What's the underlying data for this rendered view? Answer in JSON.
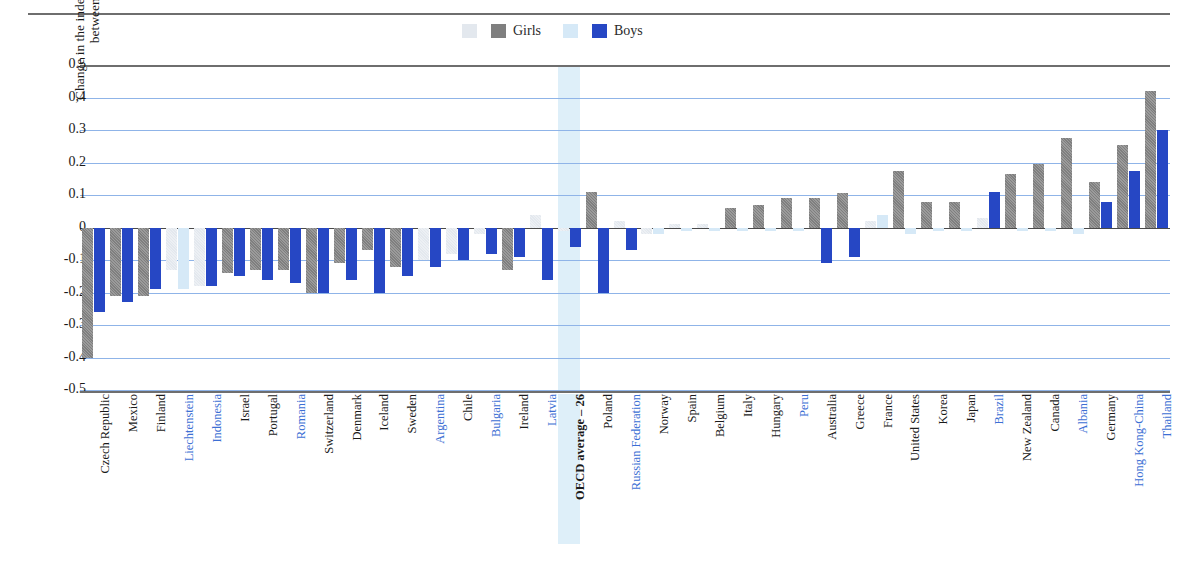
{
  "figure": {
    "title_fragment": "",
    "y_axis_title_line1": "Change in the index of enjoyment of reading",
    "y_axis_title_line2": "between 2000 and 2009"
  },
  "legend": {
    "items": [
      {
        "name": "girls-light-swatch",
        "label": "",
        "color": "#e3e8ee"
      },
      {
        "name": "girls-swatch",
        "label": "Girls",
        "color": "#7f7f7f"
      },
      {
        "name": "boys-light-swatch",
        "label": "",
        "color": "#d6e9f7"
      },
      {
        "name": "boys-swatch",
        "label": "Boys",
        "color": "#2647c4"
      }
    ]
  },
  "colors": {
    "girls_significant": "#7f7f7f",
    "girls_not_significant": "#e3e8ee",
    "boys_significant": "#2647c4",
    "boys_not_significant": "#d6e9f7",
    "gridline": "#8fb4e8",
    "partner_label": "#3c6fd4",
    "oecd_highlight": "#d8ecf8"
  },
  "chart_data": {
    "type": "bar",
    "xlabel": "",
    "ylabel": "Change in the index of enjoyment of reading between 2000 and 2009",
    "ylim": [
      -0.5,
      0.5
    ],
    "yticks": [
      "0.5",
      "0,4",
      "0.3",
      "0.2",
      "0.1",
      "0",
      "-0.1",
      "-0.2",
      "-0.3",
      "-0.4",
      "-0.5"
    ],
    "grid": true,
    "legend_position": "top-center",
    "categories": [
      "Czech Republic",
      "Mexico",
      "Finland",
      "Liechtenstein",
      "Indonesia",
      "Israel",
      "Portugal",
      "Romania",
      "Switzerland",
      "Denmark",
      "Iceland",
      "Sweden",
      "Argentina",
      "Chile",
      "Bulgaria",
      "Ireland",
      "Latvia",
      "OECD average – 26",
      "Poland",
      "Russian Federation",
      "Norway",
      "Spain",
      "Belgium",
      "Italy",
      "Hungary",
      "Peru",
      "Australia",
      "Greece",
      "France",
      "United States",
      "Korea",
      "Japan",
      "Brazil",
      "New Zealand",
      "Canada",
      "Albania",
      "Germany",
      "Hong Kong-China",
      "Thailand"
    ],
    "partner_economies": [
      "Liechtenstein",
      "Indonesia",
      "Romania",
      "Argentina",
      "Bulgaria",
      "Latvia",
      "Russian Federation",
      "Peru",
      "Brazil",
      "Albania",
      "Hong Kong-China",
      "Thailand"
    ],
    "oecd_average_category": "OECD average – 26",
    "series": [
      {
        "name": "Girls",
        "values": [
          -0.4,
          -0.21,
          -0.21,
          -0.13,
          -0.18,
          -0.14,
          -0.13,
          -0.13,
          -0.2,
          -0.11,
          -0.07,
          -0.12,
          -0.1,
          -0.08,
          -0.02,
          -0.13,
          0.04,
          -0.01,
          0.11,
          0.02,
          -0.02,
          0.01,
          0.01,
          0.06,
          0.07,
          0.09,
          0.09,
          0.105,
          0.02,
          0.175,
          0.08,
          0.08,
          0.03,
          0.165,
          0.195,
          0.275,
          0.14,
          0.255,
          0.42
        ],
        "significance": [
          true,
          true,
          true,
          false,
          false,
          true,
          true,
          true,
          true,
          true,
          true,
          true,
          false,
          false,
          false,
          true,
          false,
          false,
          true,
          false,
          false,
          false,
          false,
          true,
          true,
          true,
          true,
          true,
          false,
          true,
          true,
          true,
          false,
          true,
          true,
          true,
          true,
          true,
          true
        ]
      },
      {
        "name": "Boys",
        "values": [
          -0.26,
          -0.23,
          -0.19,
          -0.19,
          -0.18,
          -0.15,
          -0.16,
          -0.17,
          -0.2,
          -0.16,
          -0.2,
          -0.15,
          -0.12,
          -0.1,
          -0.08,
          -0.09,
          -0.16,
          -0.06,
          -0.2,
          -0.07,
          -0.02,
          -0.01,
          -0.01,
          -0.01,
          -0.01,
          -0.01,
          -0.11,
          -0.09,
          0.04,
          -0.02,
          -0.01,
          -0.01,
          0.11,
          -0.01,
          -0.01,
          -0.02,
          0.08,
          0.175,
          0.3
        ],
        "significance": [
          true,
          true,
          true,
          false,
          true,
          true,
          true,
          true,
          true,
          true,
          true,
          true,
          true,
          true,
          true,
          true,
          true,
          true,
          true,
          true,
          false,
          false,
          false,
          false,
          false,
          false,
          true,
          true,
          false,
          false,
          false,
          false,
          true,
          false,
          false,
          false,
          true,
          true,
          true
        ]
      }
    ]
  }
}
